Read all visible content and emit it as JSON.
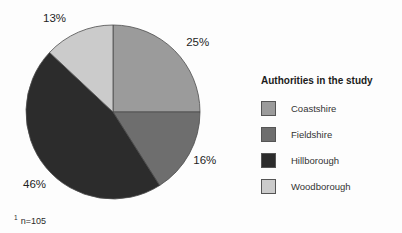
{
  "figure": {
    "footnote_marker": "1",
    "footnote_text": "n=105"
  },
  "legend": {
    "title": "Authorities in the study",
    "items": [
      {
        "label": "Coastshire",
        "color": "#9b9b9b"
      },
      {
        "label": "Fieldshire",
        "color": "#6e6e6e"
      },
      {
        "label": "Hillborough",
        "color": "#2c2c2c"
      },
      {
        "label": "Woodborough",
        "color": "#cbcbcb"
      }
    ]
  },
  "chart_data": {
    "type": "pie",
    "title": "Authorities in the study",
    "categories": [
      "Coastshire",
      "Fieldshire",
      "Hillborough",
      "Woodborough"
    ],
    "values": [
      25,
      16,
      46,
      13
    ],
    "labels": [
      "25%",
      "16%",
      "46%",
      "13%"
    ],
    "colors": [
      "#9b9b9b",
      "#6e6e6e",
      "#2c2c2c",
      "#cbcbcb"
    ],
    "unit": "%",
    "start_angle": "top",
    "direction": "clockwise",
    "legend_position": "right",
    "footnote": "n=105",
    "sample_size": 105
  }
}
